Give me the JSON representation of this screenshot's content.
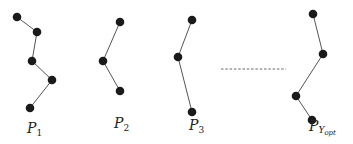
{
  "diagram": {
    "paths": [
      {
        "id": "p1",
        "label_main": "P",
        "label_sub": "1",
        "label_subsub": "",
        "node_count": 5
      },
      {
        "id": "p2",
        "label_main": "P",
        "label_sub": "2",
        "label_subsub": "",
        "node_count": 3
      },
      {
        "id": "p3",
        "label_main": "P",
        "label_sub": "3",
        "label_subsub": "",
        "node_count": 3
      },
      {
        "id": "pyopt",
        "label_main": "P",
        "label_sub": "Y",
        "label_subsub": "opt",
        "node_count": 4
      }
    ],
    "ellipsis": "dashed-line-ellipsis"
  }
}
